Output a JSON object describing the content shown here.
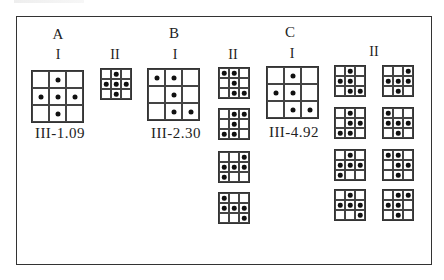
{
  "sections": [
    {
      "id": "A",
      "label": "A",
      "label_pos": [
        58,
        26
      ],
      "groups": [
        {
          "roman": "I",
          "roman_pos": [
            58,
            47
          ],
          "code": "III-1.09",
          "code_pos": [
            60,
            125
          ],
          "grids": [
            {
              "size": "big",
              "x": 31,
              "y": 70,
              "w": 53,
              "cells": [
                0,
                1,
                0,
                1,
                1,
                1,
                0,
                1,
                0
              ]
            }
          ]
        },
        {
          "roman": "II",
          "roman_pos": [
            115,
            47
          ],
          "grids": [
            {
              "size": "small",
              "x": 100,
              "y": 68,
              "w": 32,
              "cells": [
                0,
                1,
                0,
                1,
                1,
                1,
                0,
                1,
                0
              ]
            }
          ]
        }
      ]
    },
    {
      "id": "B",
      "label": "B",
      "label_pos": [
        174,
        25
      ],
      "groups": [
        {
          "roman": "I",
          "roman_pos": [
            175,
            47
          ],
          "code": "III-2.30",
          "code_pos": [
            176,
            125
          ],
          "grids": [
            {
              "size": "big",
              "x": 147,
              "y": 68,
              "w": 53,
              "cells": [
                1,
                1,
                0,
                0,
                1,
                0,
                0,
                1,
                1
              ]
            }
          ]
        },
        {
          "roman": "II",
          "roman_pos": [
            233,
            47
          ],
          "grids": [
            {
              "size": "small",
              "x": 218,
              "y": 67,
              "w": 32,
              "cells": [
                1,
                1,
                0,
                0,
                1,
                0,
                0,
                1,
                1
              ]
            },
            {
              "size": "small",
              "x": 218,
              "y": 108,
              "w": 32,
              "cells": [
                0,
                1,
                1,
                0,
                1,
                0,
                1,
                1,
                0
              ]
            },
            {
              "size": "small",
              "x": 218,
              "y": 151,
              "w": 32,
              "cells": [
                0,
                0,
                1,
                1,
                1,
                1,
                1,
                0,
                0
              ]
            },
            {
              "size": "small",
              "x": 218,
              "y": 192,
              "w": 32,
              "cells": [
                1,
                0,
                0,
                1,
                1,
                1,
                0,
                0,
                1
              ]
            }
          ]
        }
      ]
    },
    {
      "id": "C",
      "label": "C",
      "label_pos": [
        290,
        24
      ],
      "groups": [
        {
          "roman": "I",
          "roman_pos": [
            292,
            46
          ],
          "code": "III-4.92",
          "code_pos": [
            294,
            124
          ],
          "grids": [
            {
              "size": "big",
              "x": 266,
              "y": 66,
              "w": 53,
              "cells": [
                0,
                1,
                0,
                1,
                1,
                0,
                0,
                1,
                1
              ]
            }
          ]
        },
        {
          "roman": "II",
          "roman_pos": [
            374,
            44
          ],
          "grids": [
            {
              "size": "small",
              "x": 334,
              "y": 65,
              "w": 32,
              "cells": [
                0,
                1,
                0,
                1,
                1,
                0,
                0,
                1,
                1
              ]
            },
            {
              "size": "small",
              "x": 382,
              "y": 65,
              "w": 32,
              "cells": [
                0,
                0,
                1,
                1,
                1,
                1,
                0,
                1,
                0
              ]
            },
            {
              "size": "small",
              "x": 334,
              "y": 107,
              "w": 32,
              "cells": [
                0,
                1,
                0,
                0,
                1,
                1,
                1,
                1,
                0
              ]
            },
            {
              "size": "small",
              "x": 382,
              "y": 107,
              "w": 32,
              "cells": [
                1,
                0,
                0,
                1,
                1,
                1,
                0,
                1,
                0
              ]
            },
            {
              "size": "small",
              "x": 334,
              "y": 149,
              "w": 32,
              "cells": [
                0,
                1,
                0,
                1,
                1,
                1,
                1,
                0,
                0
              ]
            },
            {
              "size": "small",
              "x": 382,
              "y": 149,
              "w": 32,
              "cells": [
                1,
                1,
                0,
                0,
                1,
                1,
                0,
                1,
                0
              ]
            },
            {
              "size": "small",
              "x": 334,
              "y": 189,
              "w": 32,
              "cells": [
                0,
                1,
                0,
                1,
                1,
                1,
                0,
                0,
                1
              ]
            },
            {
              "size": "small",
              "x": 382,
              "y": 189,
              "w": 32,
              "cells": [
                0,
                1,
                1,
                1,
                1,
                0,
                0,
                1,
                0
              ]
            }
          ]
        }
      ]
    }
  ],
  "colors": {
    "line": "#333333",
    "dot": "#111111",
    "background": "#ffffff"
  }
}
